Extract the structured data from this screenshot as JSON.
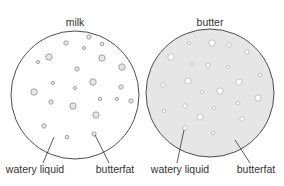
{
  "diagram": {
    "panels": [
      {
        "title": "milk",
        "fill": "#ffffff",
        "dot_fill": "#e6e6e6",
        "dot_stroke": "#9a9a9a",
        "center": [
          75,
          95
        ],
        "radius": 64,
        "dots": [
          [
            89,
            37,
            2.2
          ],
          [
            66,
            43,
            2.2
          ],
          [
            102,
            44,
            1.8
          ],
          [
            84,
            48,
            1.6
          ],
          [
            49,
            57,
            3.2
          ],
          [
            38,
            62,
            1.6
          ],
          [
            102,
            58,
            3.2
          ],
          [
            77,
            69,
            2.2
          ],
          [
            122,
            67,
            3.2
          ],
          [
            53,
            83,
            1.6
          ],
          [
            93,
            82,
            3.2
          ],
          [
            34,
            92,
            3.2
          ],
          [
            75,
            88,
            1.6
          ],
          [
            121,
            87,
            2.2
          ],
          [
            51,
            102,
            2.2
          ],
          [
            100,
            99,
            1.8
          ],
          [
            117,
            99,
            1.6
          ],
          [
            131,
            101,
            2.2
          ],
          [
            73,
            106,
            3.2
          ],
          [
            96,
            115,
            3.2
          ],
          [
            44,
            126,
            2.2
          ],
          [
            67,
            137,
            1.8
          ],
          [
            94,
            134,
            2.2
          ]
        ],
        "labels": [
          {
            "text": "watery liquid",
            "x": 35,
            "y": 170,
            "line": [
              [
                43,
                163
              ],
              [
                54,
                137
              ]
            ]
          },
          {
            "text": "butterfat",
            "x": 115,
            "y": 170,
            "line": [
              [
                109,
                163
              ],
              [
                95,
                135
              ]
            ]
          }
        ]
      },
      {
        "title": "butter",
        "fill": "#e6e6e6",
        "dot_fill": "#ffffff",
        "dot_stroke": "#bdbdbd",
        "center": [
          210,
          93
        ],
        "radius": 64,
        "dots": [
          [
            189,
            43,
            1.6
          ],
          [
            212,
            43,
            3.2
          ],
          [
            229,
            45,
            2.2
          ],
          [
            247,
            52,
            2.2
          ],
          [
            171,
            57,
            3.2
          ],
          [
            192,
            64,
            1.8
          ],
          [
            208,
            65,
            2.2
          ],
          [
            228,
            67,
            1.6
          ],
          [
            260,
            75,
            1.8
          ],
          [
            188,
            81,
            3.2
          ],
          [
            239,
            82,
            3.2
          ],
          [
            163,
            85,
            2.2
          ],
          [
            202,
            92,
            1.6
          ],
          [
            220,
            91,
            3.2
          ],
          [
            258,
            98,
            3.2
          ],
          [
            185,
            106,
            2.2
          ],
          [
            214,
            108,
            1.6
          ],
          [
            238,
            103,
            1.8
          ],
          [
            164,
            111,
            1.6
          ],
          [
            200,
            117,
            3.2
          ],
          [
            242,
            119,
            2.2
          ],
          [
            185,
            128,
            2.2
          ],
          [
            213,
            133,
            1.8
          ]
        ],
        "labels": [
          {
            "text": "watery liquid",
            "x": 180,
            "y": 170,
            "line": [
              [
                177,
                163
              ],
              [
                184,
                130
              ]
            ]
          },
          {
            "text": "butterfat",
            "x": 256,
            "y": 170,
            "line": [
              [
                250,
                163
              ],
              [
                235,
                140
              ]
            ]
          }
        ]
      }
    ]
  }
}
